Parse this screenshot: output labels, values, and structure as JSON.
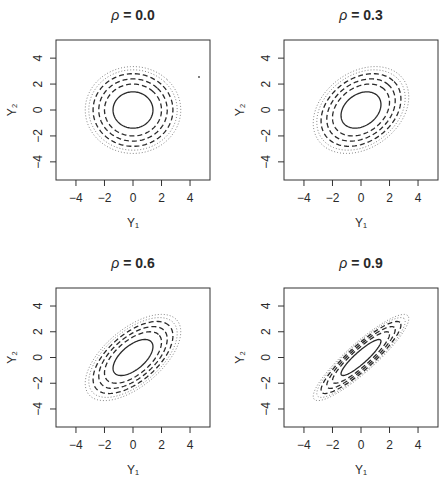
{
  "figure": {
    "caption": "",
    "background": "#ffffff",
    "ink": "#2a2a2a"
  },
  "chart_data": [
    {
      "type": "contour",
      "title": "ρ = 0.0",
      "title_symbol": "ρ",
      "title_value": "= 0.0",
      "rho": 0.0,
      "xlabel": "Y₁",
      "ylabel": "Y₂",
      "xticks": [
        -4,
        -2,
        0,
        2,
        4
      ],
      "yticks": [
        -4,
        -2,
        0,
        2,
        4
      ],
      "xlim": [
        -5.4,
        5.4
      ],
      "ylim": [
        -5.4,
        5.4
      ],
      "grid": false,
      "contour_levels_mahalanobis": [
        {
          "r": 1.4,
          "style": "solid"
        },
        {
          "r": 2.0,
          "style": "dashed"
        },
        {
          "r": 2.4,
          "style": "dashed"
        },
        {
          "r": 2.8,
          "style": "dashed"
        },
        {
          "r": 3.1,
          "style": "dotted"
        },
        {
          "r": 3.35,
          "style": "dotted"
        }
      ],
      "frame": {
        "x": 56,
        "y": 40,
        "w": 154,
        "h": 140
      }
    },
    {
      "type": "contour",
      "title": "ρ = 0.3",
      "title_symbol": "ρ",
      "title_value": "= 0.3",
      "rho": 0.3,
      "xlabel": "Y₁",
      "ylabel": "Y₂",
      "xticks": [
        -4,
        -2,
        0,
        2,
        4
      ],
      "yticks": [
        -4,
        -2,
        0,
        2,
        4
      ],
      "xlim": [
        -5.4,
        5.4
      ],
      "ylim": [
        -5.4,
        5.4
      ],
      "grid": false,
      "contour_levels_mahalanobis": [
        {
          "r": 1.4,
          "style": "solid"
        },
        {
          "r": 2.0,
          "style": "dashed"
        },
        {
          "r": 2.4,
          "style": "dashed"
        },
        {
          "r": 2.8,
          "style": "dashed"
        },
        {
          "r": 3.1,
          "style": "dotted"
        },
        {
          "r": 3.35,
          "style": "dotted"
        }
      ],
      "frame": {
        "x": 284,
        "y": 40,
        "w": 154,
        "h": 140
      }
    },
    {
      "type": "contour",
      "title": "ρ = 0.6",
      "title_symbol": "ρ",
      "title_value": "= 0.6",
      "rho": 0.6,
      "xlabel": "Y₁",
      "ylabel": "Y₂",
      "xticks": [
        -4,
        -2,
        0,
        2,
        4
      ],
      "yticks": [
        -4,
        -2,
        0,
        2,
        4
      ],
      "xlim": [
        -5.4,
        5.4
      ],
      "ylim": [
        -5.4,
        5.4
      ],
      "grid": false,
      "contour_levels_mahalanobis": [
        {
          "r": 1.4,
          "style": "solid"
        },
        {
          "r": 2.0,
          "style": "dashed"
        },
        {
          "r": 2.4,
          "style": "dashed"
        },
        {
          "r": 2.8,
          "style": "dashed"
        },
        {
          "r": 3.1,
          "style": "dotted"
        },
        {
          "r": 3.35,
          "style": "dotted"
        }
      ],
      "frame": {
        "x": 56,
        "y": 288,
        "w": 154,
        "h": 139
      }
    },
    {
      "type": "contour",
      "title": "ρ = 0.9",
      "title_symbol": "ρ",
      "title_value": "= 0.9",
      "rho": 0.9,
      "xlabel": "Y₁",
      "ylabel": "Y₂",
      "xticks": [
        -4,
        -2,
        0,
        2,
        4
      ],
      "yticks": [
        -4,
        -2,
        0,
        2,
        4
      ],
      "xlim": [
        -5.4,
        5.4
      ],
      "ylim": [
        -5.4,
        5.4
      ],
      "grid": false,
      "contour_levels_mahalanobis": [
        {
          "r": 1.4,
          "style": "solid"
        },
        {
          "r": 2.0,
          "style": "dashed"
        },
        {
          "r": 2.4,
          "style": "dashed"
        },
        {
          "r": 2.8,
          "style": "dashed"
        },
        {
          "r": 3.1,
          "style": "dotted"
        },
        {
          "r": 3.35,
          "style": "dotted"
        }
      ],
      "frame": {
        "x": 284,
        "y": 288,
        "w": 154,
        "h": 139
      }
    }
  ],
  "artifacts": [
    {
      "panel": 0,
      "x": 199,
      "y": 77,
      "note": "stray scan dot"
    }
  ]
}
